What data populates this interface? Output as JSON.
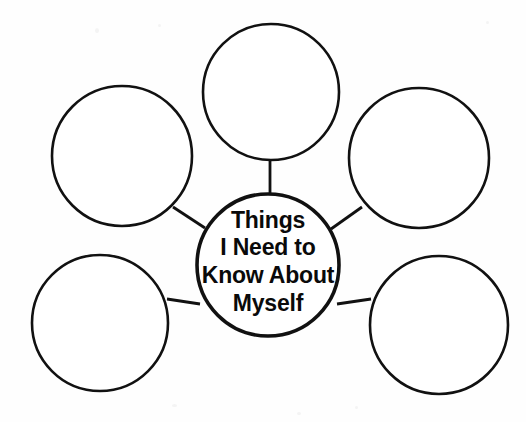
{
  "page": {
    "title": "Things I Need to Know About Myself",
    "worksheet_type": "bubble map graphic organizer",
    "background_color": "#fefefe",
    "ink_color": "#111111",
    "width": 526,
    "height": 422
  },
  "center_bubble": {
    "name": "center-bubble",
    "lines": [
      "Things",
      "I Need to",
      "Know About",
      "Myself"
    ],
    "cx": 268,
    "cy": 265,
    "r": 71,
    "stroke_width": 3.6,
    "font_size": 23
  },
  "outer_bubbles": [
    {
      "name": "bubble-top",
      "position_label": "top",
      "text": "",
      "cx": 271,
      "cy": 92,
      "r": 68,
      "stroke_width": 2.6
    },
    {
      "name": "bubble-upper-left",
      "position_label": "upper-left",
      "text": "",
      "cx": 122,
      "cy": 156,
      "r": 70,
      "stroke_width": 2.6
    },
    {
      "name": "bubble-upper-right",
      "position_label": "upper-right",
      "text": "",
      "cx": 419,
      "cy": 158,
      "r": 70,
      "stroke_width": 2.6
    },
    {
      "name": "bubble-lower-left",
      "position_label": "lower-left",
      "text": "",
      "cx": 100,
      "cy": 323,
      "r": 68,
      "stroke_width": 2.6
    },
    {
      "name": "bubble-lower-right",
      "position_label": "lower-right",
      "text": "",
      "cx": 439,
      "cy": 325,
      "r": 69,
      "stroke_width": 2.6
    }
  ],
  "connectors": [
    {
      "name": "connector-top",
      "x1": 270,
      "y1": 160,
      "x2": 270,
      "y2": 194,
      "stroke_width": 2.8
    },
    {
      "name": "connector-upper-left",
      "x1": 173,
      "y1": 207,
      "x2": 205,
      "y2": 228,
      "stroke_width": 2.8
    },
    {
      "name": "connector-upper-right",
      "x1": 362,
      "y1": 207,
      "x2": 331,
      "y2": 229,
      "stroke_width": 2.8
    },
    {
      "name": "connector-lower-left",
      "x1": 167,
      "y1": 299,
      "x2": 200,
      "y2": 304,
      "stroke_width": 2.8
    },
    {
      "name": "connector-lower-right",
      "x1": 337,
      "y1": 304,
      "x2": 371,
      "y2": 299,
      "stroke_width": 2.8
    }
  ]
}
